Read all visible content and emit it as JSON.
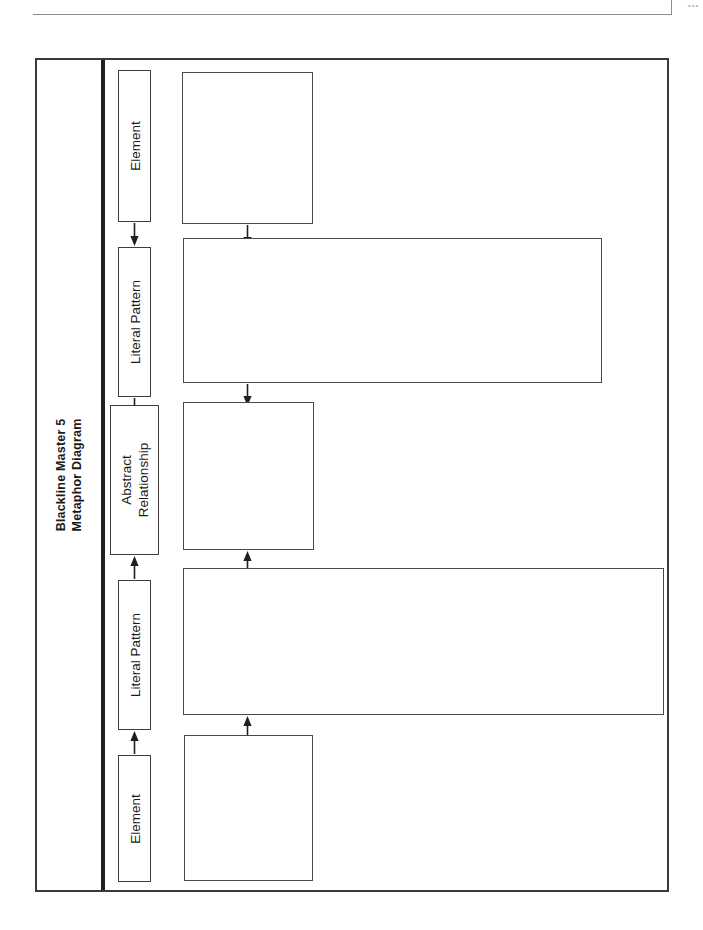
{
  "page": {
    "header_mark": "•••",
    "title_line1": "Blackline Master 5",
    "title_line2": "Metaphor Diagram"
  },
  "diagram": {
    "type": "metaphor-diagram",
    "labels": [
      {
        "id": "element-top",
        "text": "Element"
      },
      {
        "id": "literal-pattern-top",
        "text": "Literal Pattern"
      },
      {
        "id": "abstract-relationship",
        "text": "Abstract\nRelationship",
        "line1": "Abstract",
        "line2": "Relationship"
      },
      {
        "id": "literal-pattern-bottom",
        "text": "Literal Pattern"
      },
      {
        "id": "element-bottom",
        "text": "Element"
      }
    ],
    "write_boxes": [
      {
        "id": "write-box-element-top",
        "value": "",
        "placeholder": ""
      },
      {
        "id": "write-box-literal-pattern-top",
        "value": "",
        "placeholder": ""
      },
      {
        "id": "write-box-abstract-relationship",
        "value": "",
        "placeholder": ""
      },
      {
        "id": "write-box-literal-pattern-bottom",
        "value": "",
        "placeholder": ""
      },
      {
        "id": "write-box-element-bottom",
        "value": "",
        "placeholder": ""
      }
    ],
    "arrows": [
      {
        "id": "label-arrow-1",
        "direction": "down"
      },
      {
        "id": "label-arrow-2",
        "direction": "down"
      },
      {
        "id": "label-arrow-3",
        "direction": "up"
      },
      {
        "id": "label-arrow-4",
        "direction": "up"
      },
      {
        "id": "box-arrow-1",
        "direction": "down"
      },
      {
        "id": "box-arrow-2",
        "direction": "down"
      },
      {
        "id": "box-arrow-3",
        "direction": "up"
      },
      {
        "id": "box-arrow-4",
        "direction": "up"
      }
    ],
    "colors": {
      "frame": "#3a3a3a",
      "divider": "#1f1f1f",
      "box_border": "#4a4a4a",
      "text": "#1a1a1a",
      "rule": "#8d8d8d"
    }
  }
}
